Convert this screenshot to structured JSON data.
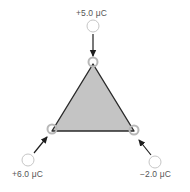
{
  "diagram": {
    "type": "physics-charges-triangle",
    "colors": {
      "triangle_fill": "#c4c4c4",
      "triangle_stroke": "#2a2a2a",
      "arrow": "#1e1e1e",
      "free_charge_fill": "#ffffff",
      "free_charge_stroke": "#bdbdbd",
      "vertex_marker": "#b8b8b8",
      "label_text": "#555555"
    },
    "charges": [
      {
        "id": "top",
        "label": "+5.0 μC",
        "value_uC": 5.0,
        "position": "top vertex"
      },
      {
        "id": "bottom-left",
        "label": "+6.0 μC",
        "value_uC": 6.0,
        "position": "bottom-left vertex"
      },
      {
        "id": "bottom-right",
        "label": "−2.0 μC",
        "value_uC": -2.0,
        "position": "bottom-right vertex"
      }
    ]
  }
}
